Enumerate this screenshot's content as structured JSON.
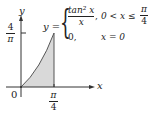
{
  "diagram": {
    "axis_labels": {
      "x": "x",
      "y": "y"
    },
    "origin_label": "0",
    "y_tick": {
      "numerator": "4",
      "denominator": "π"
    },
    "x_tick": {
      "numerator": "π",
      "denominator": "4"
    },
    "function": {
      "lhs": "y =",
      "case1_expr_num": "tan² x",
      "case1_expr_den": "x",
      "case1_sep": ",",
      "case1_condition_left": "0 < x ≤",
      "case1_condition_frac_num": "π",
      "case1_condition_frac_den": "4",
      "case2_expr": "0,",
      "case2_condition": "x = 0"
    },
    "region": {
      "shaded": true,
      "x_min": "0",
      "x_max": "π/4"
    },
    "colors": {
      "fill": "#d9d9d9",
      "stroke": "#333333"
    }
  }
}
